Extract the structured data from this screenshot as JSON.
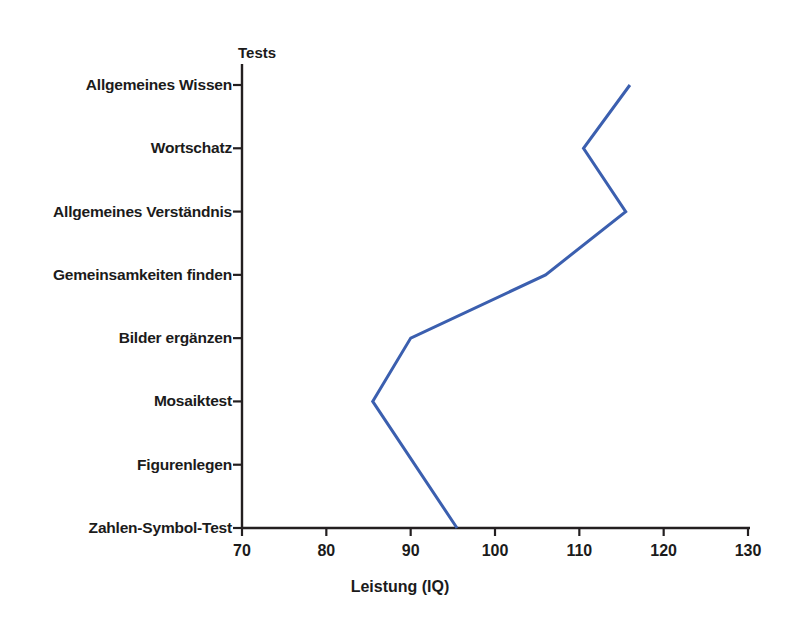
{
  "chart_data": {
    "type": "line",
    "title": "",
    "subtitle": "",
    "orientation": "horizontal-value",
    "category_axis_header": "Tests",
    "xlabel": "Leistung (IQ)",
    "ylabel": "",
    "xlim": [
      70,
      130
    ],
    "xticks": [
      70,
      80,
      90,
      100,
      110,
      120,
      130
    ],
    "xtick_labels": [
      "70",
      "80",
      "90",
      "100",
      "110",
      "120",
      "130"
    ],
    "grid": false,
    "legend": false,
    "categories": [
      "Allgemeines Wissen",
      "Wortschatz",
      "Allgemeines Verständnis",
      "Gemeinsamkeiten finden",
      "Bilder ergänzen",
      "Mosaiktest",
      "Figurenlegen",
      "Zahlen-Symbol-Test"
    ],
    "values": [
      116,
      110.5,
      115.5,
      106,
      90,
      85.5,
      null,
      95.5
    ],
    "series": [
      {
        "name": "Leistung (IQ)",
        "color": "#3B5FAF",
        "values": [
          116,
          110.5,
          115.5,
          106,
          90,
          85.5,
          null,
          95.5
        ]
      }
    ]
  },
  "style": {
    "line_color": "#3B5FAF",
    "axis_color": "#231f20",
    "background": "#ffffff",
    "text_color": "#1b1b1b"
  }
}
